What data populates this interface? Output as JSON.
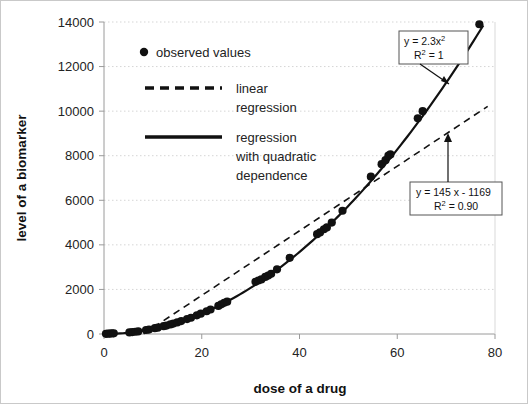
{
  "chart_data": {
    "type": "scatter",
    "title": "",
    "xlabel": "dose of a drug",
    "ylabel": "level of a biomarker",
    "xlim": [
      0,
      80
    ],
    "ylim": [
      0,
      14000
    ],
    "xticks": [
      0,
      20,
      40,
      60,
      80
    ],
    "yticks": [
      0,
      2000,
      4000,
      6000,
      8000,
      10000,
      12000,
      14000
    ],
    "grid": "horizontal-dotted",
    "legend_position": "upper-left-inside",
    "series": [
      {
        "name": "observed values",
        "type": "scatter",
        "marker": "filled-circle",
        "color": "#111111",
        "points": [
          [
            0.4,
            10
          ],
          [
            0.8,
            15
          ],
          [
            1.2,
            20
          ],
          [
            1.6,
            25
          ],
          [
            2.0,
            30
          ],
          [
            5.2,
            70
          ],
          [
            5.8,
            85
          ],
          [
            6.4,
            100
          ],
          [
            7.0,
            115
          ],
          [
            8.6,
            180
          ],
          [
            9.2,
            200
          ],
          [
            10.4,
            260
          ],
          [
            11.0,
            285
          ],
          [
            12.2,
            350
          ],
          [
            12.8,
            380
          ],
          [
            13.6,
            430
          ],
          [
            14.2,
            470
          ],
          [
            15.0,
            520
          ],
          [
            15.8,
            580
          ],
          [
            17.0,
            670
          ],
          [
            17.8,
            730
          ],
          [
            19.0,
            840
          ],
          [
            19.8,
            910
          ],
          [
            21.0,
            1020
          ],
          [
            21.8,
            1100
          ],
          [
            23.4,
            1260
          ],
          [
            24.0,
            1330
          ],
          [
            24.6,
            1400
          ],
          [
            25.2,
            1450
          ],
          [
            31.0,
            2340
          ],
          [
            31.6,
            2400
          ],
          [
            32.2,
            2450
          ],
          [
            33.0,
            2560
          ],
          [
            33.6,
            2620
          ],
          [
            34.2,
            2700
          ],
          [
            35.4,
            2900
          ],
          [
            38.0,
            3420
          ],
          [
            43.6,
            4480
          ],
          [
            44.2,
            4560
          ],
          [
            45.0,
            4700
          ],
          [
            45.6,
            4780
          ],
          [
            46.6,
            5000
          ],
          [
            48.8,
            5530
          ],
          [
            54.6,
            7060
          ],
          [
            56.8,
            7620
          ],
          [
            57.6,
            7800
          ],
          [
            58.2,
            8000
          ],
          [
            58.6,
            8060
          ],
          [
            64.2,
            9680
          ],
          [
            65.2,
            10000
          ],
          [
            76.8,
            13900
          ]
        ]
      },
      {
        "name": "linear regression",
        "type": "line",
        "style": "dashed",
        "color": "#111111",
        "equation": "y = 145 x - 1169",
        "r_squared": "0.90",
        "slope": 145,
        "intercept": -1169,
        "x_start": 8.1,
        "x_end": 78.5
      },
      {
        "name": "regression with quadratic dependence",
        "type": "line",
        "style": "solid",
        "color": "#111111",
        "equation": "y = 2.3x^2",
        "r_squared": "1",
        "coefficient": 2.3,
        "x_start": 0,
        "x_end": 77.6
      }
    ]
  },
  "axes": {
    "x_title": "dose of a drug",
    "y_title": "level of a biomarker",
    "x_tick_labels": [
      "0",
      "20",
      "40",
      "60",
      "80"
    ],
    "y_tick_labels": [
      "0",
      "2000",
      "4000",
      "6000",
      "8000",
      "10000",
      "12000",
      "14000"
    ]
  },
  "legend": {
    "items": [
      {
        "label": "observed values",
        "marker": "dot"
      },
      {
        "label_line1": "linear",
        "label_line2": "regression",
        "marker": "dashed-line"
      },
      {
        "label_line1": "regression",
        "label_line2": "with quadratic",
        "label_line3": "dependence",
        "marker": "solid-line"
      }
    ]
  },
  "annotations": [
    {
      "id": "quadratic-annotation",
      "line1_prefix": "y = 2.3x",
      "line1_sup": "2",
      "line2_prefix": "R",
      "line2_sup": "2",
      "line2_suffix": " = 1"
    },
    {
      "id": "linear-annotation",
      "line1": "y = 145 x - 1169",
      "line2_prefix": "R",
      "line2_sup": "2",
      "line2_suffix": " = 0.90"
    }
  ],
  "colors": {
    "data": "#111111",
    "grid": "#d5d5d5",
    "axis": "#9a9a9a",
    "text": "#232323",
    "border": "#c9c9c9"
  }
}
